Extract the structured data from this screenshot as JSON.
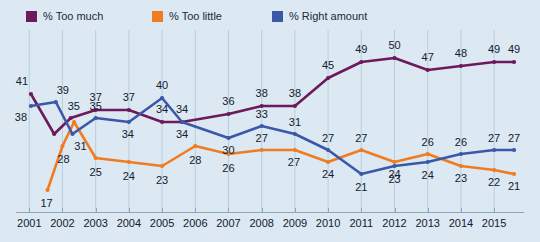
{
  "chart_data": {
    "type": "line",
    "title": "",
    "xlabel": "",
    "ylabel": "",
    "xlim": [
      2000.6,
      2015.9
    ],
    "ylim": [
      13,
      54
    ],
    "grid": "vertical",
    "legend_position": "top-left",
    "background_color": "#dce8f2",
    "x_tick_labels": [
      "2001",
      "2002",
      "2003",
      "2004",
      "2005",
      "2006",
      "2007",
      "2008",
      "2009",
      "2010",
      "2011",
      "2012",
      "2013",
      "2014",
      "2015"
    ],
    "x_ticks": [
      2001,
      2002,
      2003,
      2004,
      2005,
      2006,
      2007,
      2008,
      2009,
      2010,
      2011,
      2012,
      2013,
      2014,
      2015
    ],
    "series": [
      {
        "name": "% Too much",
        "color": "#6d1a5c",
        "x": [
          2001.05,
          2001.75,
          2002.25,
          2003.0,
          2004.0,
          2005.0,
          2005.6,
          2007.0,
          2008.0,
          2009.0,
          2010.0,
          2011.0,
          2012.0,
          2013.0,
          2014.0,
          2015.0,
          2015.6
        ],
        "values": [
          41,
          31,
          35,
          37,
          37,
          34,
          34,
          36,
          38,
          38,
          45,
          49,
          50,
          47,
          48,
          49,
          49
        ],
        "labels": [
          41,
          null,
          35,
          37,
          37,
          34,
          34,
          36,
          38,
          38,
          45,
          49,
          50,
          47,
          48,
          49,
          49
        ]
      },
      {
        "name": "% Too little",
        "color": "#f07c22",
        "x": [
          2001.55,
          2002.0,
          2002.35,
          2003.0,
          2004.0,
          2005.0,
          2006.0,
          2007.0,
          2008.0,
          2009.0,
          2010.0,
          2011.0,
          2012.0,
          2013.0,
          2014.0,
          2015.0,
          2015.6
        ],
        "values": [
          17,
          28,
          34,
          25,
          24,
          23,
          28,
          26,
          27,
          27,
          24,
          27,
          24,
          26,
          23,
          22,
          21
        ],
        "labels": [
          17,
          28,
          null,
          25,
          24,
          23,
          28,
          26,
          27,
          27,
          24,
          27,
          24,
          26,
          23,
          22,
          21
        ]
      },
      {
        "name": "% Right amount",
        "color": "#3b58a8",
        "x": [
          2001.05,
          2001.8,
          2002.3,
          2003.0,
          2004.0,
          2005.0,
          2005.6,
          2007.0,
          2008.0,
          2009.0,
          2010.0,
          2011.0,
          2012.0,
          2013.0,
          2014.0,
          2015.0,
          2015.6
        ],
        "values": [
          38,
          39,
          31,
          35,
          34,
          40,
          34,
          30,
          33,
          31,
          27,
          21,
          23,
          24,
          26,
          27,
          27
        ],
        "labels": [
          38,
          39,
          31,
          35,
          34,
          40,
          34,
          30,
          33,
          31,
          27,
          21,
          23,
          24,
          26,
          27,
          27
        ]
      }
    ]
  },
  "legend": {
    "items": [
      {
        "label": "% Too much",
        "color": "#6d1a5c"
      },
      {
        "label": "% Too little",
        "color": "#f07c22"
      },
      {
        "label": "% Right amount",
        "color": "#3b58a8"
      }
    ]
  }
}
